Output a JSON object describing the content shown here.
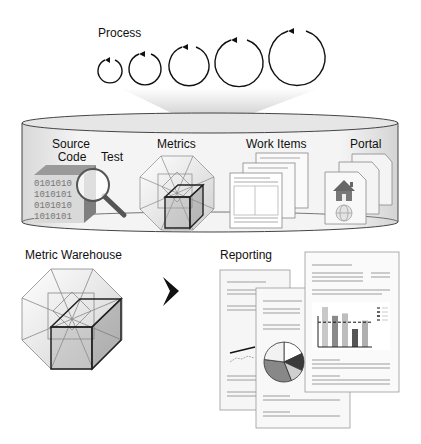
{
  "process": {
    "label": "Process",
    "cycles": [
      {
        "cx": 110,
        "cy": 71,
        "r": 12
      },
      {
        "cx": 145,
        "cy": 69,
        "r": 16
      },
      {
        "cx": 189,
        "cy": 66,
        "r": 20
      },
      {
        "cx": 239,
        "cy": 63,
        "r": 24
      },
      {
        "cx": 297,
        "cy": 58,
        "r": 28
      }
    ]
  },
  "repository": {
    "source_code_label_line1": "Source",
    "source_code_label_line2": "Code",
    "test_label": "Test",
    "metrics_label": "Metrics",
    "work_items_label": "Work Items",
    "portal_label": "Portal",
    "binary_rows": [
      "0101010",
      "1010101",
      "0101010",
      "1010101"
    ]
  },
  "warehouse": {
    "label": "Metric Warehouse"
  },
  "arrow": {
    "icon": "chevron-right-icon"
  },
  "reporting": {
    "label": "Reporting",
    "bar_chart": {
      "values": [
        100,
        78,
        84,
        45,
        66
      ],
      "shades": [
        "#c8c8c8",
        "#8a8a8a",
        "#bdbdbd",
        "#555555",
        "#b0b0b0"
      ],
      "threshold": 62
    },
    "pie_chart": {
      "slices": [
        {
          "pct": 18,
          "color": "#ffffff"
        },
        {
          "pct": 14,
          "color": "#3a3a3a"
        },
        {
          "pct": 12,
          "color": "#cfcfcf"
        },
        {
          "pct": 33,
          "color": "#888888"
        },
        {
          "pct": 23,
          "color": "#f2f2f2"
        }
      ]
    }
  }
}
